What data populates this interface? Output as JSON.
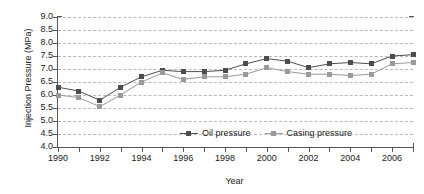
{
  "chart_data": {
    "type": "line",
    "title": "",
    "xlabel": "Year",
    "ylabel": "Injection Pressure (MPa)",
    "x": [
      1990,
      1991,
      1992,
      1993,
      1994,
      1995,
      1996,
      1997,
      1998,
      1999,
      2000,
      2001,
      2002,
      2003,
      2004,
      2005,
      2006,
      2007
    ],
    "xlim": [
      1990,
      2007
    ],
    "ylim": [
      4.0,
      9.0
    ],
    "ytick_labels": [
      "9.0",
      "8.5",
      "8.0",
      "7.5",
      "7.0",
      "6.5",
      "6.0",
      "5.5",
      "5.0",
      "4.5",
      "4.0"
    ],
    "yticks": [
      9.0,
      8.5,
      8.0,
      7.5,
      7.0,
      6.5,
      6.0,
      5.5,
      5.0,
      4.5,
      4.0
    ],
    "xtick_labels": [
      "1990",
      "1992",
      "1994",
      "1996",
      "1998",
      "2000",
      "2002",
      "2004",
      "2006"
    ],
    "xticks": [
      1990,
      1992,
      1994,
      1996,
      1998,
      2000,
      2002,
      2004,
      2006
    ],
    "grid": true,
    "grid_style": "dashed-horizontal",
    "legend_position": "inside-bottom-center",
    "series": [
      {
        "name": "Oil pressure",
        "color": "#4d4d4d",
        "marker": "square",
        "values": [
          6.3,
          6.15,
          5.8,
          6.3,
          6.7,
          6.95,
          6.9,
          6.9,
          6.95,
          7.2,
          7.4,
          7.3,
          7.05,
          7.2,
          7.25,
          7.2,
          7.5,
          7.55
        ]
      },
      {
        "name": "Casing pressure",
        "color": "#9a9a9a",
        "marker": "square",
        "values": [
          6.0,
          5.9,
          5.55,
          6.0,
          6.5,
          6.85,
          6.6,
          6.7,
          6.7,
          6.8,
          7.05,
          6.9,
          6.8,
          6.8,
          6.75,
          6.8,
          7.2,
          7.25
        ]
      }
    ]
  },
  "legend": {
    "items": [
      {
        "label": "Oil pressure"
      },
      {
        "label": "Casing pressure"
      }
    ]
  },
  "colors": {
    "oil": "#4d4d4d",
    "casing": "#9a9a9a",
    "axis": "#555555",
    "grid": "#b9b9b9",
    "background": "#ffffff"
  }
}
